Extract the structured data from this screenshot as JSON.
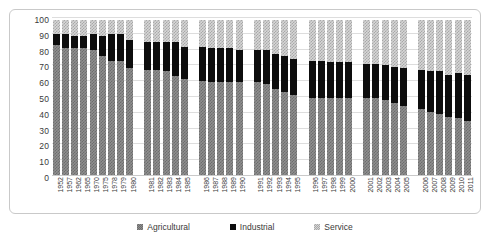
{
  "chart_data": {
    "type": "bar",
    "stacked": true,
    "title": "",
    "subtitle": "",
    "xlabel": "",
    "ylabel": "",
    "ylim": [
      0,
      100
    ],
    "yticks": [
      0,
      10,
      20,
      30,
      40,
      50,
      60,
      70,
      80,
      90,
      100
    ],
    "ytick_labels": [
      "0",
      "10",
      "20",
      "30",
      "40",
      "50",
      "60",
      "70",
      "80",
      "90",
      "100"
    ],
    "grid": true,
    "legend_position": "bottom",
    "legend": [
      "Agricultural",
      "Industrial",
      "Service"
    ],
    "categories": [
      "1952",
      "1957",
      "1962",
      "1965",
      "1970",
      "1975",
      "1978",
      "1979",
      "1980",
      "",
      "1981",
      "1982",
      "1983",
      "1984",
      "1985",
      "",
      "1986",
      "1987",
      "1988",
      "1989",
      "1990",
      "",
      "1991",
      "1992",
      "1993",
      "1994",
      "1995",
      "",
      "1996",
      "1997",
      "1998",
      "1999",
      "2000",
      "",
      "2001",
      "2002",
      "2003",
      "2004",
      "2005",
      "",
      "2006",
      "2007",
      "2008",
      "2009",
      "2010",
      "2011"
    ],
    "series": [
      {
        "name": "Agricultural",
        "color": "#8f8f8f",
        "pattern": "checker-dot",
        "values": [
          84,
          82,
          82,
          82,
          81,
          77,
          74,
          74,
          69,
          null,
          68,
          68,
          67,
          64,
          62,
          null,
          61,
          60,
          60,
          60,
          60,
          null,
          60,
          59,
          56,
          54,
          52,
          null,
          50,
          50,
          50,
          50,
          50,
          null,
          50,
          50,
          49,
          47,
          45,
          null,
          43,
          41,
          40,
          38,
          37,
          35
        ]
      },
      {
        "name": "Industrial",
        "color": "#0d0d0d",
        "pattern": "solid",
        "values": [
          7,
          9,
          8,
          8,
          10,
          13,
          17,
          17,
          18,
          null,
          18,
          18,
          19,
          22,
          21,
          null,
          22,
          22,
          22,
          22,
          21,
          null,
          21,
          22,
          22,
          23,
          23,
          null,
          24,
          24,
          23,
          23,
          23,
          null,
          22,
          22,
          22,
          23,
          24,
          null,
          25,
          26,
          27,
          27,
          29,
          30
        ]
      },
      {
        "name": "Service",
        "color": "#d6d6d6",
        "pattern": "fine-dot",
        "values": [
          9,
          9,
          10,
          10,
          9,
          10,
          9,
          9,
          13,
          null,
          14,
          14,
          14,
          14,
          17,
          null,
          17,
          18,
          18,
          18,
          19,
          null,
          19,
          19,
          22,
          23,
          25,
          null,
          26,
          26,
          27,
          27,
          27,
          null,
          28,
          28,
          29,
          30,
          31,
          null,
          32,
          33,
          33,
          35,
          34,
          35
        ]
      }
    ]
  }
}
